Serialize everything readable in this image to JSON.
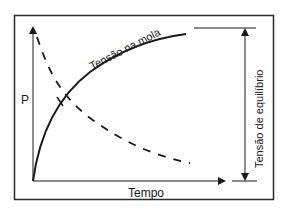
{
  "diagram": {
    "type": "line-schematic",
    "y_axis_label": "P",
    "x_axis_label": "Tempo",
    "curves": [
      {
        "name": "Tensão na mola",
        "style": "solid",
        "shape": "rising saturating curve from origin to near top"
      },
      {
        "name": "decaying curve",
        "style": "dashed",
        "shape": "decreasing curve from top-left to lower-right"
      }
    ],
    "annotations": {
      "spring_tension": "Tensão na mola",
      "equilibrium_tension": "Tensão de equilíbrio"
    },
    "colors": {
      "line": "#1a1a1a",
      "background": "#ffffff"
    }
  }
}
